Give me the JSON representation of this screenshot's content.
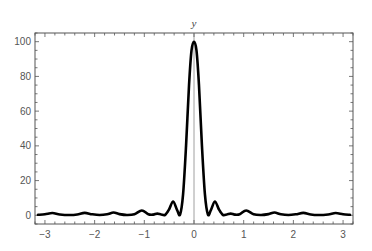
{
  "chart_data": {
    "type": "line",
    "title": "",
    "xlabel": "",
    "ylabel": "y",
    "xlim": [
      -3.2,
      3.2
    ],
    "ylim": [
      -5,
      105
    ],
    "grid": false,
    "legend": null,
    "x_ticks": [
      -3,
      -2,
      -1,
      0,
      1,
      2,
      3
    ],
    "x_tick_labels": [
      "−3",
      "−2",
      "−1",
      "0",
      "1",
      "2",
      "3"
    ],
    "y_ticks": [
      0,
      20,
      40,
      60,
      80,
      100
    ],
    "y_tick_labels": [
      "0",
      "20",
      "40",
      "60",
      "80",
      "100"
    ],
    "x_minor_step": 0.2,
    "y_minor_step": 5,
    "series": [
      {
        "name": "y",
        "color": "#000000",
        "x": [
          -3.14,
          -3.0,
          -2.85,
          -2.7,
          -2.5,
          -2.35,
          -2.2,
          -2.05,
          -1.9,
          -1.75,
          -1.62,
          -1.5,
          -1.35,
          -1.2,
          -1.05,
          -0.92,
          -0.82,
          -0.74,
          -0.66,
          -0.58,
          -0.5,
          -0.42,
          -0.34,
          -0.28,
          -0.22,
          -0.16,
          -0.1,
          -0.05,
          0.0,
          0.05,
          0.1,
          0.16,
          0.22,
          0.28,
          0.34,
          0.42,
          0.5,
          0.58,
          0.66,
          0.74,
          0.82,
          0.92,
          1.05,
          1.2,
          1.35,
          1.5,
          1.62,
          1.75,
          1.9,
          2.05,
          2.2,
          2.35,
          2.5,
          2.7,
          2.85,
          3.0,
          3.14
        ],
        "y": [
          0.3,
          0.6,
          1.3,
          0.5,
          0.2,
          0.5,
          1.4,
          0.6,
          0.2,
          0.6,
          1.6,
          0.7,
          0.2,
          0.6,
          2.8,
          0.6,
          0.4,
          1.0,
          0.5,
          0.3,
          3.5,
          8.0,
          3.0,
          0.5,
          12,
          40,
          75,
          95,
          100,
          95,
          75,
          40,
          12,
          0.5,
          3.0,
          8.0,
          3.5,
          0.3,
          0.5,
          1.0,
          0.4,
          0.6,
          2.8,
          0.6,
          0.2,
          0.7,
          1.6,
          0.6,
          0.2,
          0.6,
          1.4,
          0.5,
          0.2,
          0.5,
          1.3,
          0.6,
          0.3
        ]
      }
    ]
  },
  "frame": {
    "left": 35,
    "right": 353,
    "top": 33,
    "bottom": 224,
    "color": "#555555"
  },
  "axis_line_color": "#888888",
  "curve_width": 2.6
}
